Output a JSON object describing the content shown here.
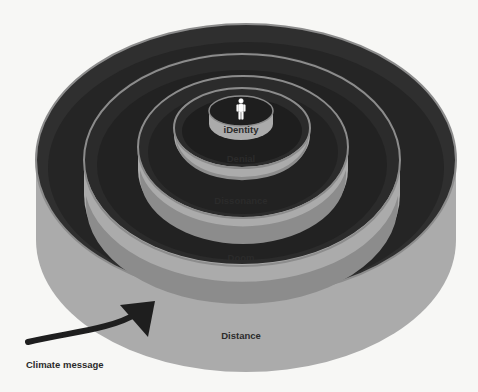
{
  "diagram": {
    "type": "nested-cylinders",
    "colors": {
      "background": "#f7f7f5",
      "wall": "#aaaaaa",
      "rim": "#8a8a8a",
      "floor": "#1c1c1c",
      "inner_top": "#2e2e2e",
      "text": "#2b2b2b",
      "arrow": "#1e1e1e",
      "figure": "#ffffff"
    },
    "layers": [
      {
        "id": "distance",
        "label": "Distance"
      },
      {
        "id": "doom",
        "label": "Doom"
      },
      {
        "id": "dissonance",
        "label": "Dissonance"
      },
      {
        "id": "denial",
        "label": "Denial"
      },
      {
        "id": "identity",
        "label": "iDentity"
      }
    ],
    "center_icon": "person-icon",
    "arrow": {
      "icon": "curved-arrow-icon",
      "label": "Climate message"
    }
  }
}
